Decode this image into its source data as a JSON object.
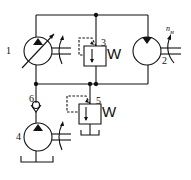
{
  "diagram": {
    "type": "hydraulic-circuit",
    "colors": {
      "line": "#111111",
      "background": "#ffffff"
    },
    "components": [
      {
        "id": "1",
        "label": "1",
        "kind": "variable-displacement-pump"
      },
      {
        "id": "2",
        "label": "2",
        "kind": "hydraulic-motor",
        "shaft_label": "n",
        "shaft_label_sub": "м"
      },
      {
        "id": "3",
        "label": "3",
        "kind": "relief-valve"
      },
      {
        "id": "4",
        "label": "4",
        "kind": "charge-pump"
      },
      {
        "id": "5",
        "label": "5",
        "kind": "relief-valve"
      },
      {
        "id": "6",
        "label": "6",
        "kind": "check-valve"
      }
    ],
    "spring_glyph": "W"
  }
}
